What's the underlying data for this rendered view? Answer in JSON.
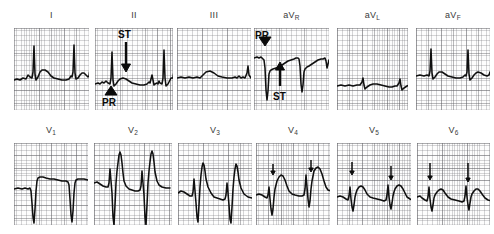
{
  "figure": {
    "kind": "12-lead-ecg",
    "rows": 2,
    "cols": 6,
    "paper": {
      "background_hex": "#fdfdfd",
      "fine_grid_hex": "#78787d",
      "bold_grid_hex": "#5a5a5f",
      "trace_hex": "#101010",
      "label_hex": "#3a3a3a",
      "annotation_hex": "#0a0a0a"
    }
  },
  "leads": [
    {
      "id": "I",
      "label_main": "I",
      "label_sub": "",
      "row": 0,
      "box": {
        "x": 14,
        "y": 28,
        "w": 75,
        "h": 82
      },
      "label_y": 10,
      "trace": "M0,52 L3,51 L6,52 L9,50 L12,51 L14,47 L16,49 L18,50 L19,44 L20,18 L21,46 L22,52 L24,49 L26,44 L28,42 L31,42 L34,44 L37,48 L40,50 L44,51 L48,52 L52,52 L55,51 L57,48 L58,49 L59,44 L60,17 L61,45 L62,51 L64,50 L66,47 L68,45 L70,45 L72,47 L74,49 L75,48 L75.5,44 L77,42 L79,43 L80,47 L82,50 L86,51 L90,51"
    },
    {
      "id": "II",
      "label_main": "II",
      "label_sub": "",
      "row": 0,
      "box": {
        "x": 95,
        "y": 28,
        "w": 78,
        "h": 82
      },
      "label_y": 10,
      "trace": "M0,56 L3,55 L5,56 L7,54 L9,55 L11,53 L13,55 L15,56 L16,50 L17,24 L18,52 L19,58 L21,56 L23,53 L25,51 L28,50 L31,51 L34,53 L37,55 L41,56 L45,57 L49,57 L52,56 L54,54 L55,55 L56,51 L57,47 L58,52 L59,57 L60,56 L62,55 L63,56 L64,53 L65,55 L67,56 L68,50 L69,22 L70,50 L71,58 L73,56 L75,52 L76,50 L78,50 L78.5,46 L79,48 L81,52 L84,55 L88,56 L92,56"
    },
    {
      "id": "III",
      "label_main": "III",
      "label_sub": "",
      "row": 0,
      "box": {
        "x": 177,
        "y": 28,
        "w": 74,
        "h": 82
      },
      "label_y": 10,
      "trace": "M0,50 L4,49 L8,50 L12,49 L16,50 L20,49 L23,50 L26,47 L29,44 L33,43 L37,45 L41,48 L45,49 L50,50 L55,50 L58,49 L60,50 L62,48 L64,50 L66,49 L68,50 L70,45 L71,38 L72,47 L74,50 L76,48 L78,46 L80,45 L83,46 L86,48 L89,49 L92,49"
    },
    {
      "id": "aVR",
      "label_main": "aV",
      "label_sub": "R",
      "row": 0,
      "box": {
        "x": 254,
        "y": 28,
        "w": 75,
        "h": 82
      },
      "label_y": 10,
      "trace": "M0,30 L3,29 L5,30 L7,29 L9,31 L10,32 L11,40 L12,62 L13,72 L14,63 L15,46 L16,43 L17,42 L19,41 L22,40 L25,39 L28,37 L31,35 L34,33 L37,32 L40,31 L42,30 L44,30 L45,31 L46,38 L47,56 L48,64 L49,57 L50,44 L51,41 L53,39 L55,38 L58,36 L61,34 L64,32 L67,31 L69,31 L71,30 L72,33 L73,40 L74,36 L75,32 L77,30 L79,30 L82,31 L85,32 L88,33 L92,33"
    },
    {
      "id": "aVL",
      "label_main": "aV",
      "label_sub": "L",
      "row": 0,
      "box": {
        "x": 337,
        "y": 28,
        "w": 71,
        "h": 82
      },
      "label_y": 10,
      "trace": "M0,58 L4,57 L8,58 L12,57 L16,58 L20,57 L23,57 L25,54 L26,50 L27,57 L28,61 L30,59 L33,57 L36,56 L40,56 L44,57 L48,58 L52,59 L55,59 L58,58 L60,58 L62,55 L63,51 L64,58 L65,62 L67,60 L70,58 L73,57 L76,58 L80,59 L84,60 L88,60"
    },
    {
      "id": "aVF",
      "label_main": "aV",
      "label_sub": "F",
      "row": 0,
      "box": {
        "x": 416,
        "y": 28,
        "w": 74,
        "h": 82
      },
      "label_y": 10,
      "trace": "M0,48 L4,47 L8,48 L11,47 L13,48 L14,43 L15,21 L16,45 L17,51 L19,49 L21,46 L23,44 L26,44 L29,46 L32,48 L36,49 L40,50 L44,50 L47,49 L49,47 L50,48 L51,44 L52,22 L53,46 L54,52 L56,50 L58,47 L60,45 L62,44 L65,45 L68,47 L71,48 L73,47 L74,44 L76,43 L78,44 L80,47 L83,49 L87,49 L91,49"
    },
    {
      "id": "V1",
      "label_main": "V",
      "label_sub": "1",
      "row": 1,
      "box": {
        "x": 14,
        "y": 143,
        "w": 74,
        "h": 82
      },
      "label_y": 125,
      "trace": "M0,46 L4,45 L8,46 L11,45 L14,46 L16,45 L17,48 L18,60 L19,74 L20,80 L21,66 L22,48 L23,38 L24,35 L26,34 L29,34 L32,35 L36,36 L40,36 L44,37 L48,38 L52,38 L54,39 L55,42 L56,56 L57,72 L58,79 L59,68 L60,50 L61,40 L62,37 L64,36 L67,36 L70,36 L74,37 L78,37 L82,38 L86,38 L90,38"
    },
    {
      "id": "V2",
      "label_main": "V",
      "label_sub": "2",
      "row": 1,
      "box": {
        "x": 94,
        "y": 143,
        "w": 78,
        "h": 82
      },
      "label_y": 125,
      "trace": "M0,40 L3,39 L6,41 L9,43 L12,44 L14,44 L15,40 L16,26 L17,38 L18,50 L19,74 L20,82 L21,62 L22,40 L23,28 L24,20 L25,12 L26,9 L27,12 L28,20 L29,30 L30,38 L32,43 L35,46 L38,47 L41,48 L44,48 L46,47 L47,43 L48,28 L49,40 L50,52 L51,74 L52,82 L53,62 L54,40 L55,28 L56,19 L57,11 L58,8 L59,11 L60,19 L61,29 L63,38 L65,42 L68,44 L72,45 L76,45"
    },
    {
      "id": "V3",
      "label_main": "V",
      "label_sub": "3",
      "row": 1,
      "box": {
        "x": 178,
        "y": 143,
        "w": 74,
        "h": 82
      },
      "label_y": 125,
      "trace": "M0,50 L3,48 L6,49 L9,51 L12,53 L14,53 L15,49 L16,36 L17,48 L18,60 L19,74 L20,79 L21,62 L22,44 L23,32 L24,24 L25,20 L26,22 L27,28 L28,36 L30,44 L33,50 L36,54 L39,55 L42,56 L45,57 L47,56 L48,52 L49,40 L50,50 L51,62 L52,76 L53,80 L54,64 L55,46 L56,34 L57,26 L58,21 L59,23 L60,29 L61,37 L63,45 L66,51 L70,54 L74,55"
    },
    {
      "id": "V4",
      "label_main": "V",
      "label_sub": "4",
      "row": 1,
      "box": {
        "x": 256,
        "y": 143,
        "w": 74,
        "h": 82
      },
      "label_y": 125,
      "trace": "M0,52 L3,51 L6,52 L9,54 L11,55 L12,52 L13,44 L14,56 L15,66 L16,72 L17,66 L18,54 L19,46 L20,42 L21,38 L23,34 L25,32 L27,33 L29,37 L31,43 L33,48 L36,51 L39,52 L43,53 L46,53 L48,52 L49,46 L50,32 L51,44 L52,56 L53,64 L54,58 L55,46 L56,38 L57,33 L58,28 L60,25 L62,24 L64,26 L66,31 L68,38 L70,44 L72,47 L75,48 L78,49 L82,49"
    },
    {
      "id": "V5",
      "label_main": "V",
      "label_sub": "5",
      "row": 1,
      "box": {
        "x": 337,
        "y": 143,
        "w": 74,
        "h": 82
      },
      "label_y": 125,
      "trace": "M0,54 L3,53 L6,54 L9,56 L11,57 L12,53 L13,44 L14,56 L15,64 L16,68 L17,62 L18,54 L19,50 L20,47 L22,44 L24,43 L26,44 L28,47 L30,51 L33,54 L36,55 L40,56 L44,57 L47,58 L49,57 L50,52 L51,42 L52,54 L53,62 L54,66 L55,60 L56,53 L57,49 L58,46 L60,43 L62,42 L64,43 L66,46 L68,50 L70,54 L73,56 L76,57 L80,58"
    },
    {
      "id": "V6",
      "label_main": "V",
      "label_sub": "6",
      "row": 1,
      "box": {
        "x": 417,
        "y": 143,
        "w": 73,
        "h": 82
      },
      "label_y": 125,
      "trace": "M0,54 L3,53 L5,55 L8,57 L10,58 L11,54 L12,44 L13,56 L14,64 L15,68 L16,62 L17,55 L18,52 L20,49 L22,47 L24,46 L26,47 L28,50 L31,54 L34,56 L38,57 L42,58 L45,59 L47,58 L48,53 L49,43 L50,54 L51,62 L52,67 L53,60 L54,54 L55,51 L57,48 L59,46 L61,46 L63,48 L65,51 L68,55 L71,57 L75,58 L79,58"
    }
  ],
  "annotations": [
    {
      "id": "st-lead-II",
      "label": "ST",
      "kind": "down-arrow-with-label-above",
      "lead": "II",
      "label_x": 118,
      "label_y": 30,
      "arrow_x": 126,
      "arrow_y0": 42,
      "arrow_y1": 72
    },
    {
      "id": "pr-lead-II",
      "label": "PR",
      "kind": "up-arrowhead-with-label-below",
      "lead": "II",
      "label_x": 102,
      "label_y": 98,
      "arrow_x": 111,
      "arrow_y": 89
    },
    {
      "id": "pr-lead-aVR",
      "label": "PR",
      "kind": "down-arrowhead-with-label-above",
      "lead": "aVR",
      "label_x": 255,
      "label_y": 31,
      "arrow_x": 265,
      "arrow_y": 43
    },
    {
      "id": "st-lead-aVR",
      "label": "ST",
      "kind": "up-arrow-with-label-below",
      "lead": "aVR",
      "label_x": 273,
      "label_y": 92,
      "arrow_x": 280,
      "arrow_y0": 86,
      "arrow_y1": 62
    },
    {
      "id": "tick-V4-a",
      "label": "",
      "kind": "small-down-tick",
      "lead": "V4",
      "arrow_x": 273,
      "arrow_y0": 164,
      "arrow_y1": 175
    },
    {
      "id": "tick-V4-b",
      "label": "",
      "kind": "small-down-tick",
      "lead": "V4",
      "arrow_x": 311,
      "arrow_y0": 160,
      "arrow_y1": 172
    },
    {
      "id": "tick-V5-a",
      "label": "",
      "kind": "small-down-tick",
      "lead": "V5",
      "arrow_x": 352,
      "arrow_y0": 162,
      "arrow_y1": 175
    },
    {
      "id": "tick-V5-b",
      "label": "",
      "kind": "small-down-tick",
      "lead": "V5",
      "arrow_x": 391,
      "arrow_y0": 166,
      "arrow_y1": 180
    },
    {
      "id": "tick-V6-a",
      "label": "",
      "kind": "small-down-tick",
      "lead": "V6",
      "arrow_x": 430,
      "arrow_y0": 163,
      "arrow_y1": 180
    },
    {
      "id": "tick-V6-b",
      "label": "",
      "kind": "small-down-tick",
      "lead": "V6",
      "arrow_x": 468,
      "arrow_y0": 163,
      "arrow_y1": 182
    }
  ]
}
